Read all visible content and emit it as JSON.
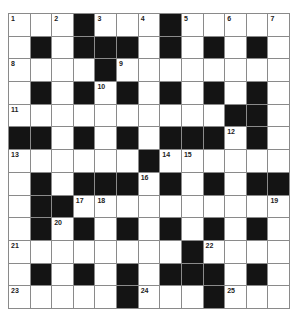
{
  "puzzle": {
    "rows": 13,
    "cols": 13,
    "colors": {
      "block": "#141414",
      "cell": "#ffffff",
      "line": "#8a8a8a",
      "number": "#222222"
    },
    "layout": [
      "1.2#3.4#5.6.7",
      ".#.###.#.#.#.",
      "8...#9.......",
      ".#.#1#.#.#.#.",
      "1.........##.",
      "##.#.#.###1#.",
      "1.....#11....",
      ".#.###1#.#.##",
      ".##11.......1",
      ".#1#.#.#.#.#.",
      "1.......#1...",
      ".#.#.#.###.#.",
      "1....#1..#1.."
    ],
    "grid": [
      [
        {
          "n": "1"
        },
        {},
        {
          "n": "2"
        },
        {
          "b": 1
        },
        {
          "n": "3"
        },
        {},
        {
          "n": "4"
        },
        {
          "b": 1
        },
        {
          "n": "5"
        },
        {},
        {
          "n": "6"
        },
        {},
        {
          "n": "7"
        }
      ],
      [
        {},
        {
          "b": 1
        },
        {},
        {
          "b": 1
        },
        {
          "b": 1
        },
        {
          "b": 1
        },
        {},
        {
          "b": 1
        },
        {},
        {
          "b": 1
        },
        {},
        {
          "b": 1
        },
        {}
      ],
      [
        {
          "n": "8"
        },
        {},
        {},
        {},
        {
          "b": 1
        },
        {
          "n": "9"
        },
        {},
        {},
        {},
        {},
        {},
        {},
        {}
      ],
      [
        {},
        {
          "b": 1
        },
        {},
        {
          "b": 1
        },
        {
          "n": "10"
        },
        {
          "b": 1
        },
        {},
        {
          "b": 1
        },
        {},
        {
          "b": 1
        },
        {},
        {
          "b": 1
        },
        {}
      ],
      [
        {
          "n": "11"
        },
        {},
        {},
        {},
        {},
        {},
        {},
        {},
        {},
        {},
        {
          "b": 1
        },
        {
          "b": 1
        },
        {}
      ],
      [
        {
          "b": 1
        },
        {
          "b": 1
        },
        {},
        {
          "b": 1
        },
        {},
        {
          "b": 1
        },
        {},
        {
          "b": 1
        },
        {
          "b": 1
        },
        {
          "b": 1
        },
        {
          "n": "12"
        },
        {
          "b": 1
        },
        {}
      ],
      [
        {
          "n": "13"
        },
        {},
        {},
        {},
        {},
        {},
        {
          "b": 1
        },
        {
          "n": "14"
        },
        {
          "n": "15"
        },
        {},
        {},
        {},
        {}
      ],
      [
        {},
        {
          "b": 1
        },
        {},
        {
          "b": 1
        },
        {
          "b": 1
        },
        {
          "b": 1
        },
        {
          "n": "16"
        },
        {
          "b": 1
        },
        {},
        {
          "b": 1
        },
        {},
        {
          "b": 1
        },
        {
          "b": 1
        }
      ],
      [
        {},
        {
          "b": 1
        },
        {
          "b": 1
        },
        {
          "n": "17"
        },
        {
          "n": "18"
        },
        {},
        {},
        {},
        {},
        {},
        {},
        {},
        {
          "n": "19"
        }
      ],
      [
        {},
        {
          "b": 1
        },
        {
          "n": "20"
        },
        {
          "b": 1
        },
        {},
        {
          "b": 1
        },
        {},
        {
          "b": 1
        },
        {},
        {
          "b": 1
        },
        {},
        {
          "b": 1
        },
        {}
      ],
      [
        {
          "n": "21"
        },
        {},
        {},
        {},
        {},
        {},
        {},
        {},
        {
          "b": 1
        },
        {
          "n": "22"
        },
        {},
        {},
        {}
      ],
      [
        {},
        {
          "b": 1
        },
        {},
        {
          "b": 1
        },
        {},
        {
          "b": 1
        },
        {},
        {
          "b": 1
        },
        {
          "b": 1
        },
        {
          "b": 1
        },
        {},
        {
          "b": 1
        },
        {}
      ],
      [
        {
          "n": "23"
        },
        {},
        {},
        {},
        {},
        {
          "b": 1
        },
        {
          "n": "24"
        },
        {},
        {},
        {
          "b": 1
        },
        {
          "n": "25"
        },
        {},
        {}
      ]
    ]
  }
}
